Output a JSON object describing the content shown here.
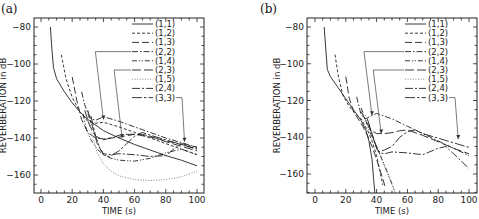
{
  "chart_data": [
    {
      "panel": "(a)",
      "type": "line",
      "title": "",
      "xlabel": "TIME (s)",
      "ylabel": "REVERBERATION in dB",
      "xlim": [
        -4,
        103
      ],
      "ylim": [
        -170,
        -76
      ],
      "xticks": [
        0,
        20,
        40,
        60,
        80,
        100
      ],
      "yticks": [
        -80,
        -100,
        -120,
        -140,
        -160
      ],
      "grid": false,
      "legend_position": "upper right",
      "series": [
        {
          "name": "(1,1)",
          "style": "solid",
          "x": [
            6,
            7,
            8,
            10,
            15,
            20,
            25,
            30,
            40,
            50,
            60,
            70,
            80,
            90,
            100
          ],
          "y": [
            -80,
            -92,
            -102,
            -108,
            -115,
            -121,
            -126,
            -130,
            -136,
            -140,
            -143.5,
            -146.5,
            -149.5,
            -152,
            -155
          ]
        },
        {
          "name": "(1,2)",
          "style": "short-dash",
          "x": [
            13,
            16,
            20,
            25,
            30,
            35,
            40,
            50,
            60,
            70,
            80,
            90,
            100
          ],
          "y": [
            -95,
            -108,
            -118,
            -126,
            -131,
            -132,
            -131.5,
            -134,
            -137,
            -140,
            -143,
            -146,
            -149
          ]
        },
        {
          "name": "(1,3)",
          "style": "long-dash",
          "x": [
            20,
            23,
            26,
            30,
            35,
            40,
            50,
            60,
            70,
            80,
            90,
            100
          ],
          "y": [
            -107,
            -120,
            -130,
            -137,
            -140,
            -140.5,
            -139.5,
            -138,
            -139.5,
            -141.5,
            -143.5,
            -146
          ]
        },
        {
          "name": "(2,2)",
          "style": "dash-dot",
          "x": [
            26,
            28,
            31,
            35,
            40,
            50,
            60,
            70,
            80,
            90,
            100
          ],
          "y": [
            -115,
            -122,
            -129,
            -130.5,
            -128.5,
            -131,
            -134,
            -137,
            -140,
            -142.5,
            -145
          ]
        },
        {
          "name": "(1,4)",
          "style": "dash-dot-dot",
          "x": [
            27,
            29,
            32,
            36,
            40,
            45,
            50,
            60,
            70,
            80,
            90,
            100
          ],
          "y": [
            -127,
            -135,
            -141,
            -146,
            -149,
            -151,
            -152,
            -152.5,
            -151,
            -148,
            -146,
            -149
          ]
        },
        {
          "name": "(2,3)",
          "style": "long-dash-space",
          "x": [
            28,
            31,
            35,
            40,
            45,
            50,
            55,
            60,
            65,
            70,
            80,
            90,
            100
          ],
          "y": [
            -125,
            -133,
            -139,
            -141,
            -140,
            -138.5,
            -138,
            -138,
            -138,
            -139,
            -142,
            -144.5,
            -147
          ]
        },
        {
          "name": "(1,5)",
          "style": "dotted",
          "x": [
            30,
            33,
            36,
            40,
            45,
            50,
            60,
            70,
            80,
            90,
            100
          ],
          "y": [
            -126,
            -139,
            -148,
            -154,
            -158,
            -160.5,
            -162.5,
            -163,
            -162.5,
            -161,
            -158
          ]
        },
        {
          "name": "(2,4)",
          "style": "dash-dot-long",
          "x": [
            30,
            33,
            36,
            40,
            45,
            50,
            60,
            70,
            80,
            85,
            90,
            100
          ],
          "y": [
            -125,
            -134,
            -143,
            -148.5,
            -149,
            -148.5,
            -149,
            -150,
            -149.5,
            -146,
            -143,
            -145
          ]
        },
        {
          "name": "(3,3)",
          "style": "long-dash-dot",
          "x": [
            32,
            35,
            38,
            40,
            43,
            45,
            50,
            55,
            60,
            65,
            70,
            80,
            90,
            100
          ],
          "y": [
            -128,
            -139,
            -146,
            -149,
            -150,
            -149.5,
            -147,
            -143,
            -139,
            -137,
            -138.5,
            -141,
            -143.5,
            -146
          ]
        }
      ],
      "annotations": [
        {
          "label": "(2,2)",
          "arrow_to": [
            40,
            -130
          ]
        },
        {
          "label": "(2,3)",
          "arrow_to": [
            52,
            -140
          ]
        },
        {
          "label": "(3,3)",
          "arrow_to": [
            92,
            -142
          ]
        }
      ]
    },
    {
      "panel": "(b)",
      "type": "line",
      "title": "",
      "xlabel": "TIME (s)",
      "ylabel": "REVERBERATION in dB",
      "xlim": [
        -4,
        103
      ],
      "ylim": [
        -170,
        -76
      ],
      "xticks": [
        0,
        20,
        40,
        60,
        80,
        100
      ],
      "yticks": [
        -80,
        -100,
        -120,
        -140,
        -160
      ],
      "grid": false,
      "legend_position": "upper right",
      "series": [
        {
          "name": "(1,1)",
          "style": "solid",
          "x": [
            6,
            7,
            8,
            10,
            15,
            20,
            25,
            30,
            33,
            35,
            37,
            38,
            39
          ],
          "y": [
            -80,
            -92,
            -103,
            -107,
            -113,
            -119,
            -125,
            -131,
            -136,
            -142,
            -152,
            -162,
            -172
          ]
        },
        {
          "name": "(1,2)",
          "style": "short-dash",
          "x": [
            13,
            15,
            18,
            22,
            26,
            30,
            34,
            37,
            40,
            42,
            44
          ],
          "y": [
            -95,
            -106,
            -117,
            -123,
            -127,
            -130,
            -136,
            -142,
            -150,
            -158,
            -166
          ]
        },
        {
          "name": "(1,3)",
          "style": "long-dash",
          "x": [
            20,
            22,
            25,
            28,
            31,
            34,
            37,
            40,
            43,
            46
          ],
          "y": [
            -107,
            -118,
            -126,
            -130,
            -134,
            -139,
            -145,
            -152,
            -160,
            -168
          ]
        },
        {
          "name": "(2,2)",
          "style": "dash-dot",
          "x": [
            27,
            30,
            33,
            36,
            40,
            50,
            60,
            70,
            80,
            90,
            100
          ],
          "y": [
            -118,
            -128,
            -130,
            -128.5,
            -127,
            -130,
            -134,
            -138,
            -142,
            -146,
            -150
          ]
        },
        {
          "name": "(1,4)",
          "style": "dash-dot-dot",
          "x": [
            30,
            33,
            36,
            40,
            44,
            48,
            52
          ],
          "y": [
            -124,
            -131,
            -138,
            -145,
            -153,
            -161,
            -170
          ]
        },
        {
          "name": "(2,3)",
          "style": "long-dash-space",
          "x": [
            30,
            33,
            36,
            40,
            45,
            50,
            55,
            60,
            70,
            80,
            90,
            100
          ],
          "y": [
            -126,
            -131,
            -136,
            -138,
            -138,
            -137.5,
            -136.5,
            -136,
            -139,
            -142.5,
            -146,
            -149
          ]
        },
        {
          "name": "(1,5)",
          "style": "dotted",
          "x": [
            33,
            36,
            40,
            44,
            48,
            52
          ],
          "y": [
            -128,
            -136,
            -145,
            -154,
            -162,
            -170
          ]
        },
        {
          "name": "(2,4)",
          "style": "dash-dot-long",
          "x": [
            34,
            37,
            40,
            42,
            45,
            50,
            60,
            70,
            80,
            85,
            90,
            100
          ],
          "y": [
            -130,
            -138,
            -146,
            -148.5,
            -149,
            -148,
            -148.5,
            -149.5,
            -146,
            -145,
            -149,
            -157
          ]
        },
        {
          "name": "(3,3)",
          "style": "long-dash-dot",
          "x": [
            35,
            38,
            41,
            45,
            50,
            55,
            60,
            65,
            70,
            80,
            90,
            100
          ],
          "y": [
            -133,
            -141,
            -148,
            -147,
            -145,
            -140,
            -137,
            -136,
            -138,
            -140.5,
            -143,
            -145.5
          ]
        }
      ],
      "annotations": [
        {
          "label": "(2,2)",
          "arrow_to": [
            37,
            -128
          ]
        },
        {
          "label": "(2,3)",
          "arrow_to": [
            43,
            -138
          ]
        },
        {
          "label": "(3,3)",
          "arrow_to": [
            93,
            -141
          ]
        }
      ]
    }
  ],
  "panels": {
    "a": {
      "label": "(a)",
      "xlabel": "TIME (s)",
      "ylabel": "REVERBERATION in dB"
    },
    "b": {
      "label": "(b)",
      "xlabel": "TIME (s)",
      "ylabel": "REVERBERATION in dB"
    }
  },
  "legend": [
    "(1,1)",
    "(1,2)",
    "(1,3)",
    "(2,2)",
    "(1,4)",
    "(2,3)",
    "(1,5)",
    "(2,4)",
    "(3,3)"
  ]
}
